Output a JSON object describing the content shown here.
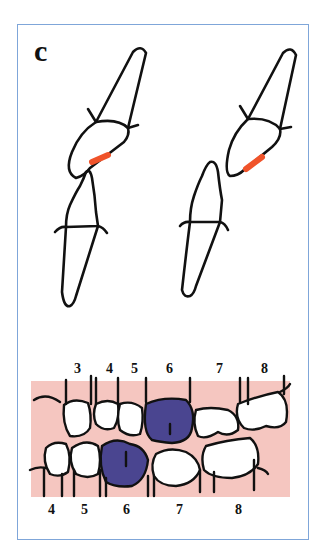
{
  "figure": {
    "panel_label": "c",
    "colors": {
      "frame_border": "#7fa6d9",
      "outline": "#111111",
      "contact_mark": "#f0532a",
      "highlight_tooth": "#4a4590",
      "gingiva": "#f5c6c0"
    },
    "top_diagrams": [
      {
        "name": "left-incisor-pair",
        "description": "upper incisor over lower incisor with red contact mark"
      },
      {
        "name": "right-incisor-pair",
        "description": "upper incisor and displaced lower incisor with red contact mark"
      }
    ],
    "arch": {
      "upper_labels": [
        "3",
        "4",
        "5",
        "6",
        "7",
        "8"
      ],
      "lower_labels": [
        "4",
        "5",
        "6",
        "7",
        "8"
      ],
      "highlighted_upper": "6",
      "highlighted_lower": "6"
    }
  }
}
